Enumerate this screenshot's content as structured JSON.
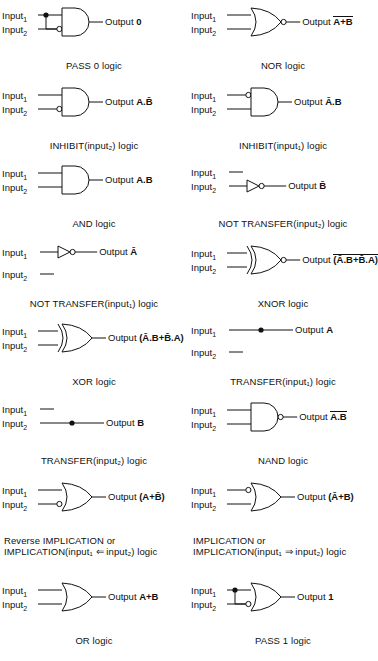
{
  "figure": {
    "input1_label": "Input",
    "input1_sub": "1",
    "input2_label": "Input",
    "input2_sub": "2",
    "output_word": "Output",
    "ink_color": "#111111",
    "background_color": "#ffffff"
  },
  "cells": [
    {
      "id": "pass0",
      "gate": "and-gate",
      "output_expr": "0",
      "output_overline": false,
      "caption": "PASS 0 logic",
      "caption_line2": "",
      "caption_align": "center",
      "in1_bubble": false,
      "in2_bubble": true,
      "out_bubble": false,
      "tie_dot": true,
      "single_line": false,
      "single_line_which": ""
    },
    {
      "id": "nor",
      "gate": "or-gate",
      "output_expr": "A+B",
      "output_overline": true,
      "caption": "NOR logic",
      "caption_line2": "",
      "caption_align": "center",
      "in1_bubble": false,
      "in2_bubble": false,
      "out_bubble": true,
      "tie_dot": false,
      "single_line": false,
      "single_line_which": ""
    },
    {
      "id": "inhibit2",
      "gate": "and-gate",
      "output_expr": "A.B̄",
      "output_overline": false,
      "caption": "INHIBIT(input₂) logic",
      "caption_line2": "",
      "caption_align": "center",
      "in1_bubble": false,
      "in2_bubble": true,
      "out_bubble": false,
      "tie_dot": false,
      "single_line": false,
      "single_line_which": ""
    },
    {
      "id": "inhibit1",
      "gate": "and-gate",
      "output_expr": "Ā.B",
      "output_overline": false,
      "caption": "INHIBIT(input₁) logic",
      "caption_line2": "",
      "caption_align": "center",
      "in1_bubble": true,
      "in2_bubble": false,
      "out_bubble": false,
      "tie_dot": false,
      "single_line": false,
      "single_line_which": ""
    },
    {
      "id": "and",
      "gate": "and-gate",
      "output_expr": "A.B",
      "output_overline": false,
      "caption": "AND logic",
      "caption_line2": "",
      "caption_align": "center",
      "in1_bubble": false,
      "in2_bubble": false,
      "out_bubble": false,
      "tie_dot": false,
      "single_line": false,
      "single_line_which": ""
    },
    {
      "id": "nottransfer2",
      "gate": "not-gate",
      "output_expr": "B̄",
      "output_overline": false,
      "caption": "NOT TRANSFER(input₂) logic",
      "caption_line2": "",
      "caption_align": "center",
      "in1_bubble": false,
      "in2_bubble": false,
      "out_bubble": true,
      "tie_dot": false,
      "single_line": true,
      "single_line_which": "input2"
    },
    {
      "id": "nottransfer1",
      "gate": "not-gate",
      "output_expr": "Ā",
      "output_overline": false,
      "caption": "NOT TRANSFER(input₁) logic",
      "caption_line2": "",
      "caption_align": "center",
      "in1_bubble": false,
      "in2_bubble": false,
      "out_bubble": true,
      "tie_dot": false,
      "single_line": true,
      "single_line_which": "input1"
    },
    {
      "id": "xnor",
      "gate": "xor-gate",
      "output_expr": "(Ā.B+B̄.A)",
      "output_overline": true,
      "caption": "XNOR logic",
      "caption_line2": "",
      "caption_align": "center",
      "in1_bubble": false,
      "in2_bubble": false,
      "out_bubble": true,
      "tie_dot": false,
      "single_line": false,
      "single_line_which": ""
    },
    {
      "id": "xor",
      "gate": "xor-gate",
      "output_expr": "(Ā.B+B̄.A)",
      "output_overline": false,
      "caption": "XOR logic",
      "caption_line2": "",
      "caption_align": "center",
      "in1_bubble": false,
      "in2_bubble": false,
      "out_bubble": false,
      "tie_dot": false,
      "single_line": false,
      "single_line_which": ""
    },
    {
      "id": "transfer1",
      "gate": "wire",
      "output_expr": "A",
      "output_overline": false,
      "caption": "TRANSFER(input₁) logic",
      "caption_line2": "",
      "caption_align": "center",
      "in1_bubble": false,
      "in2_bubble": false,
      "out_bubble": false,
      "tie_dot": true,
      "single_line": true,
      "single_line_which": "input1"
    },
    {
      "id": "transfer2",
      "gate": "wire",
      "output_expr": "B",
      "output_overline": false,
      "caption": "TRANSFER(input₂) logic",
      "caption_line2": "",
      "caption_align": "center",
      "in1_bubble": false,
      "in2_bubble": false,
      "out_bubble": false,
      "tie_dot": true,
      "single_line": true,
      "single_line_which": "input2"
    },
    {
      "id": "nand",
      "gate": "and-gate",
      "output_expr": "A.B",
      "output_overline": true,
      "caption": "NAND logic",
      "caption_line2": "",
      "caption_align": "center",
      "in1_bubble": false,
      "in2_bubble": false,
      "out_bubble": true,
      "tie_dot": false,
      "single_line": false,
      "single_line_which": ""
    },
    {
      "id": "revimpl",
      "gate": "or-gate",
      "output_expr": "(A+B̄)",
      "output_overline": false,
      "caption": "Reverse IMPLICATION or",
      "caption_line2": "IMPLICATION(input₁ ⇐ input₂) logic",
      "caption_align": "left",
      "in1_bubble": false,
      "in2_bubble": true,
      "out_bubble": false,
      "tie_dot": false,
      "single_line": false,
      "single_line_which": ""
    },
    {
      "id": "impl",
      "gate": "or-gate",
      "output_expr": "(Ā+B)",
      "output_overline": false,
      "caption": "IMPLICATION or",
      "caption_line2": "IMPLICATION(input₁ ⇒ input₂) logic",
      "caption_align": "left",
      "in1_bubble": true,
      "in2_bubble": false,
      "out_bubble": false,
      "tie_dot": false,
      "single_line": false,
      "single_line_which": ""
    },
    {
      "id": "or",
      "gate": "or-gate",
      "output_expr": "A+B",
      "output_overline": false,
      "caption": "OR logic",
      "caption_line2": "",
      "caption_align": "center",
      "in1_bubble": false,
      "in2_bubble": false,
      "out_bubble": false,
      "tie_dot": false,
      "single_line": false,
      "single_line_which": ""
    },
    {
      "id": "pass1",
      "gate": "or-gate",
      "output_expr": "1",
      "output_overline": false,
      "caption": "PASS 1 logic",
      "caption_line2": "",
      "caption_align": "center",
      "in1_bubble": false,
      "in2_bubble": true,
      "out_bubble": false,
      "tie_dot": true,
      "single_line": false,
      "single_line_which": ""
    }
  ]
}
